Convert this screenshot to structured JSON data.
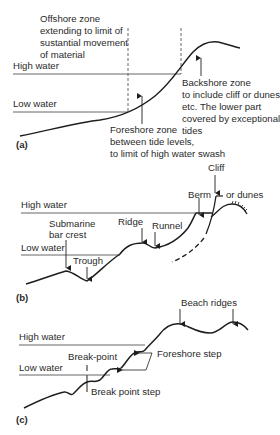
{
  "panels": {
    "a": {
      "tag": "(a)",
      "high_water": "High water",
      "low_water": "Low water",
      "offshore": [
        "Offshore zone",
        "extending to limit of",
        "sustantial movement",
        "of material"
      ],
      "backshore": [
        "Backshore zone",
        "to include cliff or dunes,",
        "etc. The lower part",
        "covered by exceptional",
        "tides"
      ],
      "foreshore": [
        "Foreshore zone",
        "between tide levels,",
        "to limit of high water swash"
      ]
    },
    "b": {
      "tag": "(b)",
      "high_water": "High water",
      "low_water": "Low water",
      "submarine": [
        "Submarine",
        "bar crest"
      ],
      "trough": "Trough",
      "ridge": "Ridge",
      "runnel": "Runnel",
      "berm": "Berm",
      "cliff": "Cliff",
      "dunes": "or dunes"
    },
    "c": {
      "tag": "(c)",
      "high_water": "High water",
      "low_water": "Low water",
      "beach_ridges": "Beach ridges",
      "break_point": "Break-point",
      "foreshore_step": "Foreshore step",
      "break_point_step": "Break point step"
    }
  },
  "colors": {
    "line": "#1e1e1e",
    "text": "#2a2a2a",
    "background": "#ffffff"
  }
}
